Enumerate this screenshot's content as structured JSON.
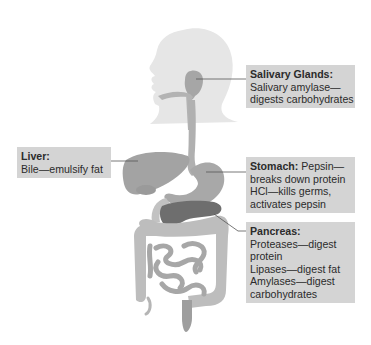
{
  "diagram": {
    "colors": {
      "background": "#ffffff",
      "label_box": "#d4d4d4",
      "label_text": "#2b2b2b",
      "head_silhouette": "#e6e6e6",
      "organ": "#a9a9a9",
      "organ_dark": "#6e6e6e",
      "intestine": "#bdbdbd",
      "leader_line": "#555555"
    },
    "labels": {
      "salivary": {
        "title": "Salivary Glands:",
        "lines": [
          "Salivary amylase—",
          "digests carbohydrates"
        ]
      },
      "liver": {
        "title": "Liver:",
        "lines": [
          "Bile—emulsify fat"
        ]
      },
      "stomach": {
        "title": "Stomach:",
        "title_suffix": " Pepsin—",
        "lines": [
          "breaks down protein",
          "HCl—kills germs,",
          "activates pepsin"
        ]
      },
      "pancreas": {
        "title": "Pancreas:",
        "lines": [
          "Proteases—digest",
          "protein",
          "Lipases—digest fat",
          "Amylases—digest",
          "carbohydrates"
        ]
      }
    }
  }
}
